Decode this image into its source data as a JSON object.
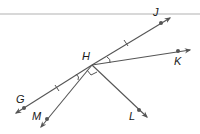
{
  "diagram": {
    "vertex": {
      "label": "H",
      "x": 92,
      "y": 65,
      "label_x": 82,
      "label_y": 60
    },
    "rays": [
      {
        "name": "ray-hj",
        "point": "J",
        "dot": [
          161,
          23
        ],
        "tip": [
          170,
          18
        ],
        "label_pos": [
          153,
          16
        ]
      },
      {
        "name": "ray-hk",
        "point": "K",
        "dot": [
          178,
          51
        ],
        "tip": [
          190,
          50
        ],
        "label_pos": [
          174,
          65
        ]
      },
      {
        "name": "ray-hg",
        "point": "G",
        "dot": [
          24,
          108
        ],
        "tip": [
          16,
          113
        ],
        "label_pos": [
          16,
          103
        ]
      },
      {
        "name": "ray-hm",
        "point": "M",
        "dot": [
          47,
          119
        ],
        "tip": [
          41,
          127
        ],
        "label_pos": [
          32,
          120
        ]
      },
      {
        "name": "ray-hl",
        "point": "L",
        "dot": [
          139,
          110
        ],
        "tip": [
          147,
          117
        ],
        "label_pos": [
          129,
          120
        ]
      }
    ],
    "marks": {
      "congruent_ticks": [
        "HJ",
        "HG"
      ],
      "congruent_angles": [
        "JHK",
        "GHM"
      ],
      "right_angle": "MHL"
    },
    "colors": {
      "line": "#555555",
      "dot": "#555555",
      "top_rule": "#d8d8d8"
    }
  }
}
